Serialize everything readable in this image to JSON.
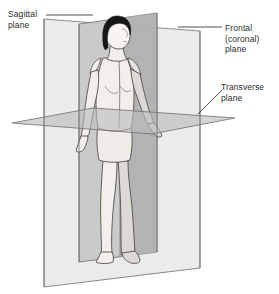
{
  "diagram": {
    "labels": {
      "sagittal": "Sagittal\nplane",
      "frontal": "Frontal\n(coronal)\nplane",
      "transverse": "Transverse\nplane"
    },
    "colors": {
      "background": "#ffffff",
      "outline": "#4a4a4a",
      "plane_light": "#e8e8e8",
      "plane_mid": "#c9c9c9",
      "plane_dark": "#a8a8a8",
      "body_fill": "#f0ece8",
      "body_shaded": "#cdcac6",
      "hair": "#1a1a1a",
      "label_text": "#2b2b2b",
      "leader_line": "#3a3a3a"
    },
    "planes": [
      {
        "name": "sagittal",
        "label": "Sagittal plane",
        "orientation": "vertical-parasagittal",
        "description": "Vertical plane dividing body into left and right"
      },
      {
        "name": "frontal",
        "label": "Frontal (coronal) plane",
        "orientation": "vertical-frontal",
        "description": "Vertical plane dividing body into anterior and posterior"
      },
      {
        "name": "transverse",
        "label": "Transverse plane",
        "orientation": "horizontal",
        "description": "Horizontal plane dividing body into superior and inferior"
      }
    ]
  }
}
